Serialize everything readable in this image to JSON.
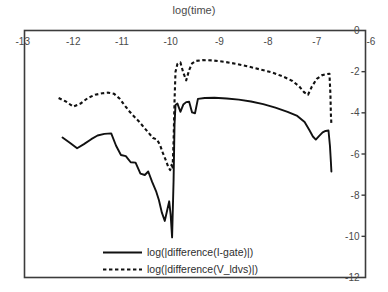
{
  "chart_data": {
    "type": "line",
    "title": "log(time)",
    "xlabel": "log(time)",
    "ylabel": "",
    "xlim": [
      -13,
      -6
    ],
    "ylim": [
      -12,
      0
    ],
    "xticks": [
      -13,
      -12,
      -11,
      -10,
      -9,
      -8,
      -7,
      -6
    ],
    "xticklabels": [
      "-13",
      "-12",
      "-11",
      "-10",
      "-9",
      "-8",
      "-7",
      "-6"
    ],
    "xaxis_position": "top",
    "yticks": [
      0,
      -2,
      -4,
      -6,
      -8,
      -10,
      -12
    ],
    "yticklabels": [
      "0",
      "-2",
      "-4",
      "-6",
      "-8",
      "-10",
      "-12"
    ],
    "yaxis_position": "right",
    "grid": false,
    "legend_position": "bottom-center",
    "series": [
      {
        "name": "log(|difference(I-gate)|)",
        "style": "solid",
        "color": "#111111",
        "points": [
          [
            -12.22,
            -5.2
          ],
          [
            -12.07,
            -5.45
          ],
          [
            -11.92,
            -5.72
          ],
          [
            -11.78,
            -5.52
          ],
          [
            -11.63,
            -5.28
          ],
          [
            -11.5,
            -5.1
          ],
          [
            -11.36,
            -5.02
          ],
          [
            -11.22,
            -5.0
          ],
          [
            -11.12,
            -5.6
          ],
          [
            -11.02,
            -6.05
          ],
          [
            -10.92,
            -6.1
          ],
          [
            -10.82,
            -6.4
          ],
          [
            -10.72,
            -6.42
          ],
          [
            -10.62,
            -6.95
          ],
          [
            -10.53,
            -7.02
          ],
          [
            -10.46,
            -6.85
          ],
          [
            -10.38,
            -7.35
          ],
          [
            -10.3,
            -7.8
          ],
          [
            -10.24,
            -8.25
          ],
          [
            -10.18,
            -8.85
          ],
          [
            -10.12,
            -9.25
          ],
          [
            -10.07,
            -8.72
          ],
          [
            -10.03,
            -8.3
          ],
          [
            -10.0,
            -8.95
          ],
          [
            -9.97,
            -10.05
          ],
          [
            -9.94,
            -7.3
          ],
          [
            -9.92,
            -4.55
          ],
          [
            -9.9,
            -3.62
          ],
          [
            -9.86,
            -3.55
          ],
          [
            -9.8,
            -3.95
          ],
          [
            -9.74,
            -3.6
          ],
          [
            -9.68,
            -3.48
          ],
          [
            -9.62,
            -3.46
          ],
          [
            -9.56,
            -3.98
          ],
          [
            -9.5,
            -4.02
          ],
          [
            -9.44,
            -3.32
          ],
          [
            -9.3,
            -3.28
          ],
          [
            -9.1,
            -3.27
          ],
          [
            -8.85,
            -3.3
          ],
          [
            -8.6,
            -3.36
          ],
          [
            -8.35,
            -3.45
          ],
          [
            -8.1,
            -3.58
          ],
          [
            -7.85,
            -3.75
          ],
          [
            -7.6,
            -3.95
          ],
          [
            -7.4,
            -4.15
          ],
          [
            -7.25,
            -4.45
          ],
          [
            -7.15,
            -4.85
          ],
          [
            -7.08,
            -5.15
          ],
          [
            -7.02,
            -5.3
          ],
          [
            -6.95,
            -5.12
          ],
          [
            -6.88,
            -4.95
          ],
          [
            -6.82,
            -4.88
          ],
          [
            -6.76,
            -4.86
          ],
          [
            -6.73,
            -5.6
          ],
          [
            -6.71,
            -6.4
          ],
          [
            -6.7,
            -6.85
          ]
        ]
      },
      {
        "name": "log(|difference(V_ldvs)|)",
        "style": "dashed",
        "color": "#111111",
        "points": [
          [
            -12.3,
            -3.28
          ],
          [
            -12.15,
            -3.45
          ],
          [
            -12.0,
            -3.7
          ],
          [
            -11.85,
            -3.55
          ],
          [
            -11.7,
            -3.28
          ],
          [
            -11.55,
            -3.12
          ],
          [
            -11.4,
            -3.05
          ],
          [
            -11.28,
            -3.02
          ],
          [
            -11.16,
            -3.08
          ],
          [
            -11.05,
            -3.3
          ],
          [
            -10.95,
            -3.62
          ],
          [
            -10.85,
            -3.92
          ],
          [
            -10.75,
            -4.18
          ],
          [
            -10.65,
            -4.42
          ],
          [
            -10.55,
            -4.7
          ],
          [
            -10.45,
            -4.98
          ],
          [
            -10.36,
            -5.22
          ],
          [
            -10.28,
            -5.3
          ],
          [
            -10.22,
            -5.55
          ],
          [
            -10.16,
            -5.95
          ],
          [
            -10.1,
            -6.3
          ],
          [
            -10.05,
            -6.62
          ],
          [
            -10.01,
            -6.78
          ],
          [
            -9.98,
            -6.52
          ],
          [
            -9.96,
            -6.72
          ],
          [
            -9.94,
            -5.4
          ],
          [
            -9.92,
            -3.4
          ],
          [
            -9.9,
            -2.0
          ],
          [
            -9.86,
            -1.62
          ],
          [
            -9.8,
            -1.55
          ],
          [
            -9.74,
            -2.05
          ],
          [
            -9.68,
            -2.42
          ],
          [
            -9.62,
            -1.92
          ],
          [
            -9.56,
            -1.6
          ],
          [
            -9.48,
            -1.48
          ],
          [
            -9.35,
            -1.44
          ],
          [
            -9.15,
            -1.45
          ],
          [
            -8.9,
            -1.52
          ],
          [
            -8.65,
            -1.62
          ],
          [
            -8.4,
            -1.75
          ],
          [
            -8.15,
            -1.9
          ],
          [
            -7.9,
            -2.05
          ],
          [
            -7.68,
            -2.25
          ],
          [
            -7.5,
            -2.45
          ],
          [
            -7.36,
            -2.72
          ],
          [
            -7.26,
            -3.0
          ],
          [
            -7.18,
            -3.12
          ],
          [
            -7.1,
            -2.72
          ],
          [
            -7.0,
            -2.35
          ],
          [
            -6.9,
            -2.18
          ],
          [
            -6.8,
            -2.12
          ],
          [
            -6.74,
            -2.1
          ],
          [
            -6.72,
            -3.1
          ],
          [
            -6.71,
            -4.1
          ],
          [
            -6.7,
            -4.55
          ]
        ]
      }
    ]
  }
}
